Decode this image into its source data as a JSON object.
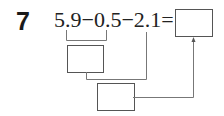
{
  "problem": {
    "number": "7",
    "expression": "5.9−0.5−2.1=",
    "terms": [
      "5.9",
      "0.5",
      "2.1"
    ],
    "operators": [
      "−",
      "−",
      "="
    ]
  },
  "boxes": {
    "answer": "",
    "step1": "",
    "step2": ""
  },
  "colors": {
    "text": "#222222",
    "lines": "#777777"
  }
}
